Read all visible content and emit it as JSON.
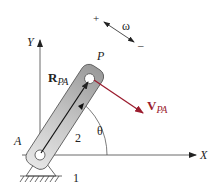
{
  "diagram": {
    "type": "kinematics-link",
    "labels": {
      "y_axis": "Y",
      "x_axis": "X",
      "point_p": "P",
      "point_a": "A",
      "r_vector_main": "R",
      "r_vector_sub": "PA",
      "v_vector_main": "V",
      "v_vector_sub": "PA",
      "theta": "θ",
      "omega": "ω",
      "omega_plus": "+",
      "omega_minus": "–",
      "link_number": "2",
      "ground_number": "1"
    },
    "colors": {
      "velocity_vector": "#9b1c2e",
      "link_fill": "#c8c8c8",
      "line": "#222222"
    }
  }
}
